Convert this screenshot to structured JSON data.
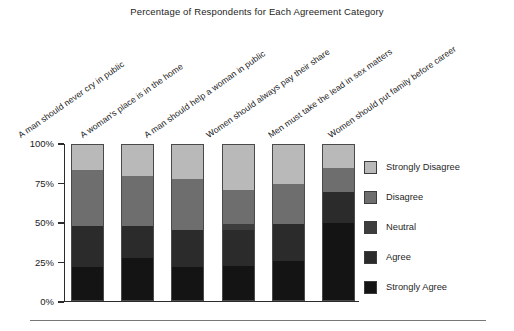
{
  "chart_data": {
    "type": "bar",
    "subtype": "stacked-bar-100-percent",
    "title": "Percentage of Respondents for Each Agreement Category",
    "xlabel": "",
    "ylabel": "",
    "ylim": [
      0,
      100
    ],
    "ytick_labels": [
      "0%",
      "25%",
      "50%",
      "75%",
      "100%"
    ],
    "ytick_values": [
      0,
      25,
      50,
      75,
      100
    ],
    "grid": false,
    "legend_position": "right",
    "stack_order_bottom_to_top": [
      "Strongly Agree",
      "Agree",
      "Neutral",
      "Disagree",
      "Strongly Disagree"
    ],
    "categories": [
      "A man should never cry in public",
      "A woman's place is in the home",
      "A man should help a woman in public",
      "Women should always pay their share",
      "Men must take the lead in sex matters",
      "Women should put family before career"
    ],
    "series": [
      {
        "name": "Strongly Agree",
        "color": "#141414",
        "values": [
          21,
          27,
          21,
          22,
          25,
          50
        ]
      },
      {
        "name": "Agree",
        "color": "#2b2b2b",
        "values": [
          27,
          21,
          24,
          23,
          24,
          20
        ]
      },
      {
        "name": "Neutral",
        "color": "#3d3d3d",
        "values": [
          0,
          0,
          0,
          4,
          0,
          0
        ]
      },
      {
        "name": "Disagree",
        "color": "#6e6e6e",
        "values": [
          36,
          32,
          33,
          22,
          26,
          15
        ]
      },
      {
        "name": "Strongly Disagree",
        "color": "#b9b9b9",
        "values": [
          16,
          20,
          22,
          29,
          25,
          15
        ]
      }
    ]
  },
  "legend": {
    "items": [
      {
        "label": "Strongly Disagree",
        "color": "#b9b9b9"
      },
      {
        "label": "Disagree",
        "color": "#6e6e6e"
      },
      {
        "label": "Neutral",
        "color": "#3d3d3d"
      },
      {
        "label": "Agree",
        "color": "#2b2b2b"
      },
      {
        "label": "Strongly Agree",
        "color": "#141414"
      }
    ]
  }
}
